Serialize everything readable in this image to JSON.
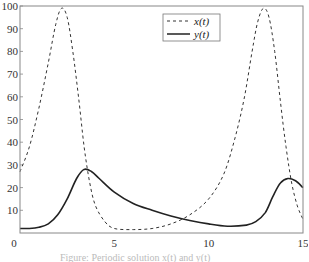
{
  "chart_data": {
    "type": "line",
    "title": "",
    "xlabel": "",
    "ylabel": "",
    "xlim": [
      0,
      15
    ],
    "ylim": [
      0,
      100
    ],
    "grid": false,
    "legend_position": "upper center-right",
    "x_ticks": [
      "0",
      "5",
      "10",
      "15"
    ],
    "y_ticks": [
      "10",
      "20",
      "30",
      "40",
      "50",
      "60",
      "70",
      "80",
      "90",
      "100"
    ],
    "x_tick_values": [
      0,
      5,
      10,
      15
    ],
    "y_tick_values": [
      10,
      20,
      30,
      40,
      50,
      60,
      70,
      80,
      90,
      100
    ],
    "series": [
      {
        "name": "x(t)",
        "style": "dashed",
        "color": "#333333",
        "t": [
          0,
          0.5,
          1.0,
          1.5,
          1.9,
          2.2,
          2.5,
          2.8,
          3.1,
          3.4,
          3.7,
          4.0,
          4.5,
          5.0,
          6.0,
          7.0,
          8.0,
          9.0,
          10.0,
          10.8,
          11.4,
          11.9,
          12.3,
          12.6,
          12.9,
          13.2,
          13.5,
          13.8,
          14.1,
          14.4,
          14.7,
          15.0
        ],
        "values": [
          27,
          38,
          55,
          75,
          92,
          99,
          95,
          80,
          60,
          38,
          22,
          12,
          5,
          2,
          1.5,
          2,
          4,
          8,
          15,
          26,
          42,
          60,
          80,
          93,
          99,
          95,
          80,
          58,
          38,
          22,
          12,
          6
        ]
      },
      {
        "name": "y(t)",
        "style": "solid",
        "color": "#222222",
        "t": [
          0,
          0.5,
          1.0,
          1.5,
          2.0,
          2.5,
          3.0,
          3.4,
          3.8,
          4.2,
          5.0,
          6.0,
          7.0,
          8.0,
          9.0,
          10.0,
          11.0,
          12.0,
          12.5,
          13.0,
          13.4,
          13.8,
          14.2,
          14.6,
          15.0
        ],
        "values": [
          2,
          2,
          2.5,
          4,
          8,
          15,
          24,
          28,
          27,
          24,
          18,
          13,
          10,
          7.5,
          5.5,
          4,
          3,
          3.5,
          5,
          9,
          16,
          22,
          24,
          23,
          20
        ]
      }
    ]
  },
  "legend": {
    "items": [
      {
        "label": "x(t)",
        "style": "dashed"
      },
      {
        "label": "y(t)",
        "style": "solid"
      }
    ]
  },
  "caption": "Figure: Periodic solution x(t) and y(t)"
}
